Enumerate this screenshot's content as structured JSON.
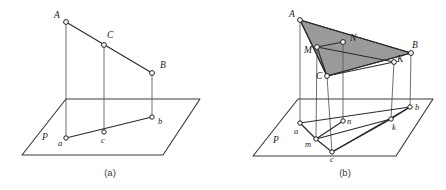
{
  "figure": {
    "background_color": "#ffffff",
    "line_color": "#2b2b2b",
    "node_fill": "#ffffff",
    "shade_color": "#9a9a9a",
    "panels": [
      {
        "id": "panel-a",
        "caption": "(a)",
        "caption_pos": {
          "x": 110,
          "y": 176
        },
        "plane_label": "P",
        "plane_label_pos": {
          "x": 42,
          "y": 140
        },
        "plane_polygon": "66,99 200,99 163,155 22,155",
        "shaded": false,
        "space_points": [
          {
            "name": "A",
            "label": "A",
            "x": 66,
            "y": 22,
            "label_x": 54,
            "label_y": 18
          },
          {
            "name": "C",
            "label": "C",
            "x": 104,
            "y": 45,
            "label_x": 107,
            "label_y": 38
          },
          {
            "name": "B",
            "label": "B",
            "x": 152,
            "y": 73,
            "label_x": 160,
            "label_y": 68
          }
        ],
        "plane_points": [
          {
            "name": "a",
            "label": "a",
            "x": 66,
            "y": 138,
            "label_x": 58,
            "label_y": 146
          },
          {
            "name": "c",
            "label": "c",
            "x": 104,
            "y": 132,
            "label_x": 101,
            "label_y": 143
          },
          {
            "name": "b",
            "label": "b",
            "x": 152,
            "y": 117,
            "label_x": 158,
            "label_y": 124
          }
        ],
        "segments": [
          {
            "name": "segment-AB",
            "from": "A",
            "to": "B",
            "weight": "thick"
          },
          {
            "name": "segment-ab",
            "from": "a",
            "to": "b",
            "weight": "thick"
          },
          {
            "name": "projector-Aa",
            "from": "A",
            "to": "a",
            "weight": "thin"
          },
          {
            "name": "projector-Cc",
            "from": "C",
            "to": "c",
            "weight": "thin"
          },
          {
            "name": "projector-Bb",
            "from": "B",
            "to": "b",
            "weight": "thin"
          }
        ]
      },
      {
        "id": "panel-b",
        "caption": "(b)",
        "caption_pos": {
          "x": 345,
          "y": 176
        },
        "plane_label": "P",
        "plane_label_pos": {
          "x": 273,
          "y": 143
        },
        "plane_polygon": "298,99 433,99 396,156 253,156",
        "shaded": true,
        "triangle_vertices": [
          "A",
          "B",
          "C"
        ],
        "space_points": [
          {
            "name": "A",
            "label": "A",
            "x": 300,
            "y": 20,
            "label_x": 289,
            "label_y": 17
          },
          {
            "name": "N",
            "label": "N",
            "x": 343,
            "y": 42,
            "label_x": 350,
            "label_y": 41
          },
          {
            "name": "M",
            "label": "M",
            "x": 317,
            "y": 47,
            "label_x": 304,
            "label_y": 53
          },
          {
            "name": "B",
            "label": "B",
            "x": 411,
            "y": 53,
            "label_x": 412,
            "label_y": 48
          },
          {
            "name": "K",
            "label": "K",
            "x": 394,
            "y": 62,
            "label_x": 397,
            "label_y": 62
          },
          {
            "name": "C",
            "label": "C",
            "x": 327,
            "y": 76,
            "label_x": 316,
            "label_y": 79
          }
        ],
        "plane_points": [
          {
            "name": "a",
            "label": "a",
            "x": 300,
            "y": 123,
            "label_x": 294,
            "label_y": 134
          },
          {
            "name": "n",
            "label": "n",
            "x": 343,
            "y": 121,
            "label_x": 347,
            "label_y": 124
          },
          {
            "name": "m",
            "label": "m",
            "x": 316,
            "y": 139,
            "label_x": 305,
            "label_y": 147
          },
          {
            "name": "k",
            "label": "k",
            "x": 391,
            "y": 119,
            "label_x": 392,
            "label_y": 130
          },
          {
            "name": "b",
            "label": "b",
            "x": 410,
            "y": 107,
            "label_x": 415,
            "label_y": 110
          },
          {
            "name": "c",
            "label": "c",
            "x": 332,
            "y": 152,
            "label_x": 330,
            "label_y": 162
          }
        ],
        "segments": [
          {
            "name": "segment-AB",
            "from": "A",
            "to": "B",
            "weight": "thick"
          },
          {
            "name": "segment-AC",
            "from": "A",
            "to": "C",
            "weight": "thick"
          },
          {
            "name": "segment-CB",
            "from": "C",
            "to": "B",
            "weight": "thick"
          },
          {
            "name": "segment-MN",
            "from": "M",
            "to": "N",
            "weight": "thick"
          },
          {
            "name": "segment-MK",
            "from": "M",
            "to": "K",
            "weight": "thick"
          },
          {
            "name": "segment-MC",
            "from": "M",
            "to": "C",
            "weight": "thick"
          },
          {
            "name": "segment-CK",
            "from": "C",
            "to": "K",
            "weight": "thick"
          },
          {
            "name": "segment-ab",
            "from": "a",
            "to": "b",
            "weight": "thick"
          },
          {
            "name": "segment-am",
            "from": "a",
            "to": "m",
            "weight": "thick"
          },
          {
            "name": "segment-mn",
            "from": "m",
            "to": "n",
            "weight": "thick"
          },
          {
            "name": "segment-mk",
            "from": "m",
            "to": "k",
            "weight": "thick"
          },
          {
            "name": "segment-mc",
            "from": "m",
            "to": "c",
            "weight": "thick"
          },
          {
            "name": "segment-ck",
            "from": "c",
            "to": "k",
            "weight": "thick"
          },
          {
            "name": "segment-cb",
            "from": "c",
            "to": "b",
            "weight": "thick"
          },
          {
            "name": "segment-kb",
            "from": "k",
            "to": "b",
            "weight": "thick"
          },
          {
            "name": "projector-Aa",
            "from": "A",
            "to": "a",
            "weight": "thin"
          },
          {
            "name": "projector-Mm",
            "from": "M",
            "to": "m",
            "weight": "thin"
          },
          {
            "name": "projector-Nn",
            "from": "N",
            "to": "n",
            "weight": "thin"
          },
          {
            "name": "projector-Cc",
            "from": "C",
            "to": "c",
            "weight": "thin"
          },
          {
            "name": "projector-Kk",
            "from": "K",
            "to": "k",
            "weight": "thin"
          },
          {
            "name": "projector-Bb",
            "from": "B",
            "to": "b",
            "weight": "thin"
          }
        ]
      }
    ]
  }
}
